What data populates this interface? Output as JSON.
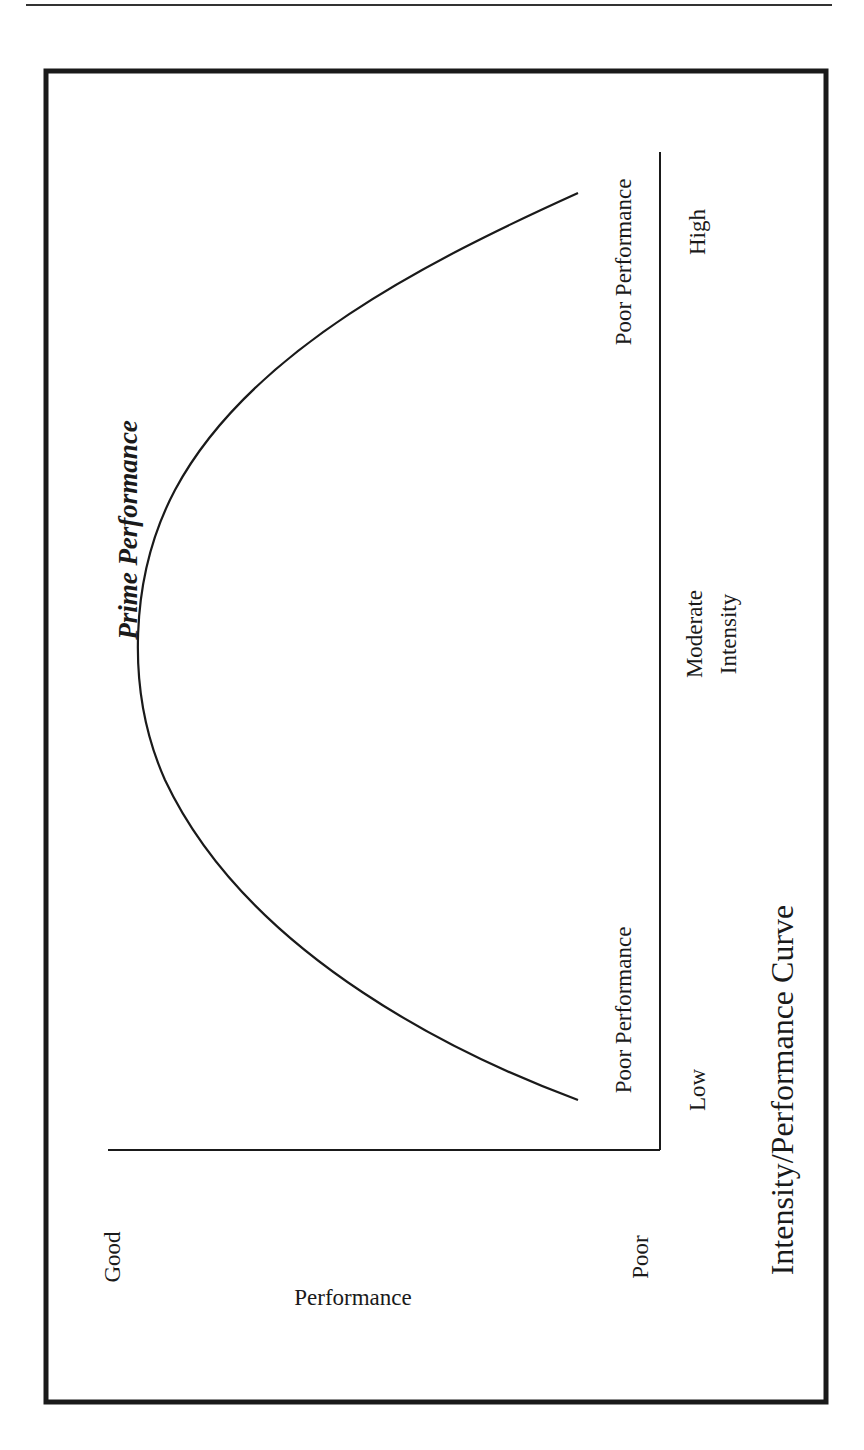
{
  "page": {
    "header_rule": {
      "x1": 26,
      "x2": 832,
      "y": 5,
      "stroke": "#333333",
      "width": 2
    },
    "frame": {
      "x": 46,
      "y": 71,
      "width": 780,
      "height": 1331,
      "stroke": "#1a1a1a",
      "stroke_width": 5
    }
  },
  "chart_data": {
    "type": "line",
    "title": "Intensity/Performance Curve",
    "orientation": "rotated 90° counter-clockwise (x-axis drawn vertically, y-axis drawn horizontally)",
    "xlabel": "Intensity",
    "ylabel": "Performance",
    "x_tick_labels": [
      "Low",
      "Moderate Intensity",
      "High"
    ],
    "y_tick_labels": [
      "Good",
      "Poor"
    ],
    "annotations": [
      "Poor Performance",
      "Prime Performance",
      "Poor Performance"
    ],
    "grid": false,
    "legend": null,
    "xlim": [
      "Low",
      "High"
    ],
    "ylim": [
      "Poor",
      "Good"
    ],
    "x": [
      0.0,
      0.1,
      0.2,
      0.3,
      0.4,
      0.5,
      0.6,
      0.7,
      0.8,
      0.9,
      1.0
    ],
    "values": [
      0.05,
      0.32,
      0.55,
      0.74,
      0.88,
      0.97,
      0.98,
      0.9,
      0.74,
      0.5,
      0.05
    ],
    "value_note": "Inverted-U curve: performance peaks at moderate intensity (Prime Performance) and is poor at both low and high intensity; units are qualitative (0 = Poor, 1 = Good)",
    "axes_px": {
      "intensity_axis": {
        "x": 660,
        "y1": 152,
        "y2": 1150
      },
      "performance_axis": {
        "y": 1150,
        "x1": 108,
        "x2": 660
      }
    },
    "curve_path": "M 578 1100 C 470 1060, 250 960, 165 780 C 125 690, 130 575, 175 490 C 250 350, 430 260, 578 193",
    "curve_stroke": "#1a1a1a",
    "labels_px": {
      "poor_perf_high": {
        "text": "Poor Performance",
        "x": 631,
        "y": 262
      },
      "high": {
        "text": "High",
        "x": 705,
        "y": 232
      },
      "prime": {
        "text": "Prime Performance",
        "x": 137,
        "y": 530
      },
      "moderate": {
        "text": "Moderate",
        "x": 702,
        "y": 634
      },
      "intensity": {
        "text": "Intensity",
        "x": 736,
        "y": 634
      },
      "poor_perf_low": {
        "text": "Poor Performance",
        "x": 631,
        "y": 1010
      },
      "low": {
        "text": "Low",
        "x": 705,
        "y": 1090
      },
      "title": {
        "text": "Intensity/Performance Curve",
        "x": 793,
        "y": 1090
      },
      "good": {
        "text": "Good",
        "x": 120,
        "y": 1257
      },
      "performance": {
        "text": "Performance",
        "x": 353,
        "y": 1305
      },
      "poor": {
        "text": "Poor",
        "x": 648,
        "y": 1257
      }
    }
  }
}
